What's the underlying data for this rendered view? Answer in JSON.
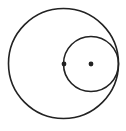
{
  "diagram": {
    "width": 126,
    "height": 131,
    "background": "#ffffff",
    "stroke_color": "#222222",
    "stroke_width": 1.6,
    "large_circle": {
      "cx": 63.5,
      "cy": 63.5,
      "r": 55
    },
    "small_circle": {
      "cx": 91,
      "cy": 64,
      "r": 27.5
    },
    "points": [
      {
        "name": "center-large",
        "cx": 64,
        "cy": 64,
        "r": 2.4
      },
      {
        "name": "center-small",
        "cx": 91,
        "cy": 64,
        "r": 2.4
      }
    ]
  }
}
